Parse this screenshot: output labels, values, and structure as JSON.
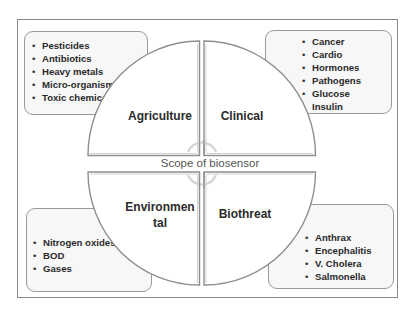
{
  "title": "Scope of biosensor",
  "colors": {
    "frame": "#8a8a8a",
    "quadrant_stroke": "#8f8f8f",
    "box_fill": "#f7f7f7",
    "text": "#2b2b2b",
    "center_text": "#555555"
  },
  "quadrants": [
    {
      "position": "top-left",
      "label": "Agriculture",
      "items": [
        "Pesticides",
        "Antibiotics",
        "Heavy metals",
        "Micro-organism",
        "Toxic chemicals"
      ]
    },
    {
      "position": "top-right",
      "label": "Clinical",
      "items": [
        "Cancer",
        "Cardio",
        "Hormones",
        "Pathogens",
        "Glucose",
        "Insulin"
      ]
    },
    {
      "position": "bottom-left",
      "label_line1": "Environmen",
      "label_line2": "tal",
      "label": "Environmental",
      "items": [
        "Nitrogen oxides",
        "BOD",
        "Gases"
      ]
    },
    {
      "position": "bottom-right",
      "label": "Biothreat",
      "items": [
        "Anthrax",
        "Encephalitis",
        "V. Cholera",
        "Salmonella"
      ]
    }
  ],
  "center_icon": "cycle-arrows-icon"
}
